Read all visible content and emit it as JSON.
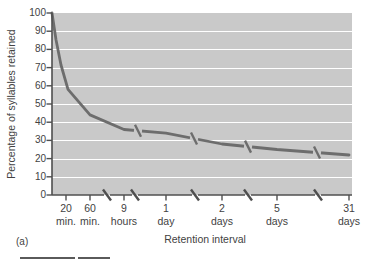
{
  "figure_label": "(a)",
  "chart_data": {
    "type": "line",
    "title": "",
    "xlabel": "Retention interval",
    "ylabel": "Percentage of syllables retained",
    "ylim": [
      0,
      100
    ],
    "yticks": [
      100,
      90,
      80,
      70,
      60,
      50,
      40,
      30,
      20,
      10,
      0
    ],
    "categories": [
      "0",
      "20 min.",
      "60 min.",
      "9 hours",
      "1 day",
      "2 days",
      "5 days",
      "31 days"
    ],
    "xtick_labels": [
      [
        "20",
        "min."
      ],
      [
        "60",
        "min."
      ],
      [
        "9",
        "hours"
      ],
      [
        "1",
        "day"
      ],
      [
        "2",
        "days"
      ],
      [
        "5",
        "days"
      ],
      [
        "31",
        "days"
      ]
    ],
    "values": [
      100,
      58,
      44,
      36,
      34,
      28,
      25,
      22
    ],
    "grid": "horizontal-white-lines",
    "legend": "none",
    "x_axis_scale_breaks": [
      "60 min.-9 hours",
      "9 hours-1 day",
      "1 day-2 days",
      "2 days-5 days",
      "5 days-31 days"
    ],
    "curve_scale_breaks": [
      "9 hours-1 day",
      "1 day-2 days",
      "2 days-5 days",
      "5 days-31 days"
    ],
    "colors": {
      "plot_bg": "#c9c9c9",
      "gridline": "#ffffff",
      "curve": "#6d6d6d",
      "axis": "#4f4f4f",
      "text": "#424242",
      "page_bg": "#ffffff",
      "crop_border": "#5a5a5a"
    }
  }
}
